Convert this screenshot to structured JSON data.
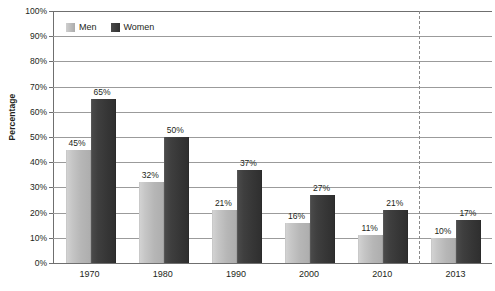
{
  "chart_data": {
    "type": "bar",
    "title": "",
    "xlabel": "",
    "ylabel": "Percentage",
    "categories": [
      "1970",
      "1980",
      "1990",
      "2000",
      "2010",
      "2013"
    ],
    "series": [
      {
        "name": "Men",
        "color": "#b8b8b8",
        "values": [
          45,
          32,
          21,
          16,
          11,
          10
        ],
        "labels": [
          "45%",
          "32%",
          "21%",
          "16%",
          "11%",
          "10%"
        ]
      },
      {
        "name": "Women",
        "color": "#3a3a3a",
        "values": [
          65,
          50,
          37,
          27,
          21,
          17
        ],
        "labels": [
          "65%",
          "50%",
          "37%",
          "27%",
          "21%",
          "17%"
        ]
      }
    ],
    "ylim": [
      0,
      100
    ],
    "ytick_labels": [
      "100%",
      "90%",
      "80%",
      "70%",
      "60%",
      "50%",
      "40%",
      "30%",
      "20%",
      "10%",
      "0%"
    ],
    "ytick_values": [
      100,
      90,
      80,
      70,
      60,
      50,
      40,
      30,
      20,
      10,
      0
    ],
    "grid": true,
    "legend_position": "top-left",
    "annotations": [
      {
        "name": "category-divider",
        "type": "vertical-dashed-line",
        "after_category": "2010",
        "color": "#8a8a8a"
      }
    ]
  },
  "legend": {
    "items": [
      {
        "label": "Men",
        "swatch": "men-swatch"
      },
      {
        "label": "Women",
        "swatch": "women-swatch"
      }
    ]
  },
  "axes": {
    "y_title": "Percentage"
  }
}
